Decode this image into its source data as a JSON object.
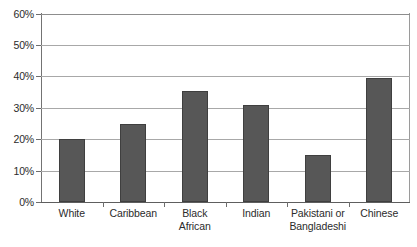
{
  "chart_data": {
    "type": "bar",
    "title": "",
    "subtitle": "",
    "xlabel": "",
    "ylabel": "",
    "categories": [
      "White",
      "Caribbean",
      "Black African",
      "Indian",
      "Pakistani or Bangladeshi",
      "Chinese"
    ],
    "category_lines": [
      [
        "White",
        ""
      ],
      [
        "Caribbean",
        ""
      ],
      [
        "Black",
        "African"
      ],
      [
        "Indian",
        ""
      ],
      [
        "Pakistani or",
        "Bangladeshi"
      ],
      [
        "Chinese",
        ""
      ]
    ],
    "values": [
      20,
      25,
      35.5,
      31,
      15,
      39.5
    ],
    "value_labels": [
      "20%",
      "25%",
      "35.5%",
      "31%",
      "15%",
      "39.5%"
    ],
    "ylim": [
      0,
      60
    ],
    "yticks": [
      0,
      10,
      20,
      30,
      40,
      50,
      60
    ],
    "ytick_labels": [
      "0%",
      "10%",
      "20%",
      "30%",
      "40%",
      "50%",
      "60%"
    ],
    "grid": true,
    "grid_axis": "y",
    "legend": null,
    "legend_position": "none",
    "bar_color": "#575757",
    "bar_edge_color": "#3f3f3f",
    "gridline_color": "#a8a8a8",
    "axis_color": "#5e5e5e",
    "text_color": "#2b2b2b",
    "background": "#ffffff"
  }
}
